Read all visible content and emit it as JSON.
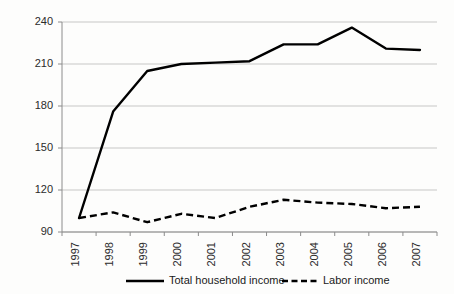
{
  "chart_data": {
    "type": "line",
    "title": "",
    "subtitle": "",
    "xlabel": "",
    "ylabel": "",
    "categories": [
      "1997",
      "1998",
      "1999",
      "2000",
      "2001",
      "2002",
      "2003",
      "2004",
      "2005",
      "2006",
      "2007"
    ],
    "series": [
      {
        "name": "Total household income",
        "style": "solid",
        "color": "#000000",
        "values": [
          100,
          176,
          205,
          210,
          211,
          212,
          224,
          224,
          236,
          221,
          220
        ]
      },
      {
        "name": "Labor income",
        "style": "dashed",
        "color": "#000000",
        "values": [
          100,
          104,
          97,
          103,
          100,
          108,
          113,
          111,
          110,
          107,
          108
        ]
      }
    ],
    "ylim": [
      90,
      240
    ],
    "yticks": [
      90,
      120,
      150,
      180,
      210,
      240
    ],
    "ytick_labels": [
      "90",
      "120",
      "150",
      "180",
      "210",
      "240"
    ],
    "grid": true,
    "grid_axis": "y",
    "legend_position": "bottom",
    "xtick_rotation": -90
  },
  "legend": {
    "items": [
      {
        "label": "Total household income",
        "style": "solid"
      },
      {
        "label": "Labor income",
        "style": "dashed"
      }
    ]
  },
  "colors": {
    "line": "#000000",
    "grid": "#b9b9b9",
    "axis": "#8c8c8c",
    "text": "#2b2b2b",
    "background": "#fdfdfc"
  }
}
